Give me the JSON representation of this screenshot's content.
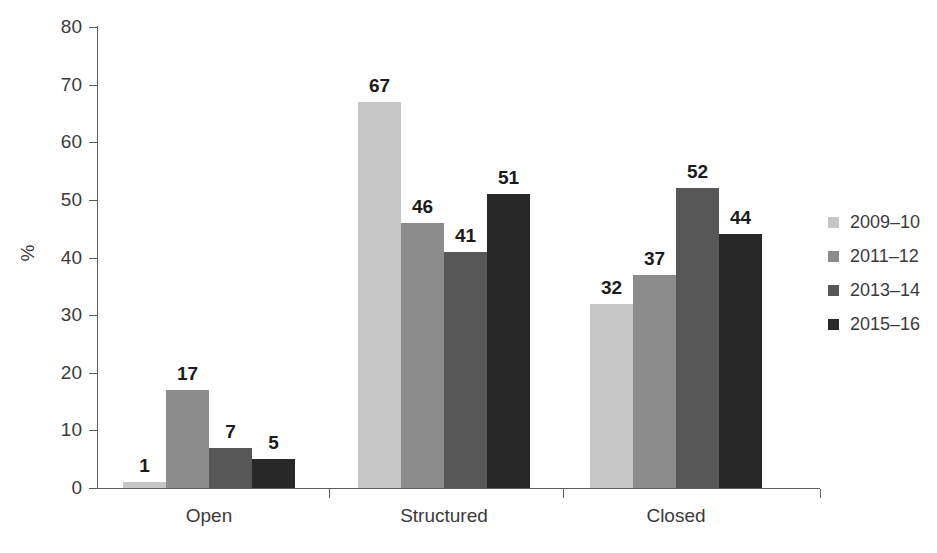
{
  "chart_data": {
    "type": "bar",
    "title": "",
    "xlabel": "",
    "ylabel": "%",
    "ylim": [
      0,
      80
    ],
    "yticks": [
      0,
      10,
      20,
      30,
      40,
      50,
      60,
      70,
      80
    ],
    "grid": false,
    "legend_position": "right",
    "categories": [
      "Open",
      "Structured",
      "Closed"
    ],
    "series": [
      {
        "name": "2009–10",
        "color": "#c6c6c6",
        "values": [
          1,
          67,
          32
        ]
      },
      {
        "name": "2011–12",
        "color": "#8c8c8c",
        "values": [
          17,
          46,
          37
        ]
      },
      {
        "name": "2013–14",
        "color": "#575757",
        "values": [
          7,
          41,
          52
        ]
      },
      {
        "name": "2015–16",
        "color": "#282828",
        "values": [
          5,
          51,
          44
        ]
      }
    ],
    "data_labels": [
      [
        "1",
        "17",
        "7",
        "5"
      ],
      [
        "67",
        "46",
        "41",
        "51"
      ],
      [
        "32",
        "37",
        "52",
        "44"
      ]
    ],
    "axis_color": "#5d5d5d",
    "text_color": "#3b3b3b",
    "label_color": "#1b1b1b"
  }
}
